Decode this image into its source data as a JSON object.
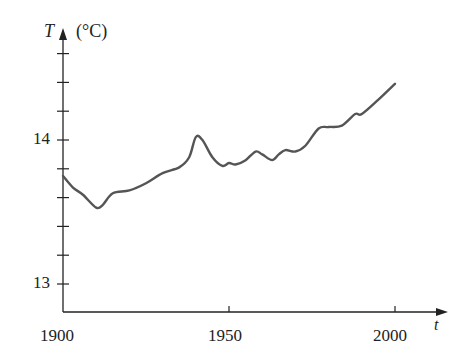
{
  "chart_data": {
    "type": "line",
    "title": "",
    "xlabel": "t",
    "ylabel": "T",
    "ylabel_unit": "(°C)",
    "xlim": [
      1900,
      2010
    ],
    "ylim": [
      12.8,
      14.7
    ],
    "x_ticks": [
      1900,
      1950,
      2000
    ],
    "x_tick_labels": [
      "1900",
      "1950",
      "2000"
    ],
    "y_ticks": [
      13.0,
      13.2,
      13.4,
      13.6,
      13.8,
      14.0,
      14.2,
      14.4,
      14.6
    ],
    "y_tick_labels": [
      "13",
      "",
      "",
      "",
      "",
      "14",
      "",
      "",
      ""
    ],
    "grid": false,
    "legend": null,
    "series": [
      {
        "name": "Global average temperature",
        "x": [
          1900,
          1903,
          1906,
          1910,
          1912,
          1915,
          1920,
          1925,
          1930,
          1935,
          1938,
          1940,
          1942,
          1945,
          1948,
          1950,
          1952,
          1955,
          1958,
          1960,
          1963,
          1965,
          1967,
          1970,
          1973,
          1977,
          1980,
          1984,
          1988,
          1990,
          1995,
          2000
        ],
        "values": [
          13.75,
          13.67,
          13.62,
          13.53,
          13.55,
          13.63,
          13.65,
          13.7,
          13.77,
          13.81,
          13.88,
          14.02,
          14.0,
          13.88,
          13.82,
          13.84,
          13.83,
          13.86,
          13.92,
          13.9,
          13.86,
          13.9,
          13.93,
          13.92,
          13.96,
          14.08,
          14.09,
          14.1,
          14.18,
          14.18,
          14.28,
          14.39
        ]
      }
    ]
  },
  "labels": {
    "y_axis_symbol": "T",
    "y_axis_unit": "(°C)",
    "x_axis_symbol": "t",
    "y14": "14",
    "y13": "13",
    "x1900": "1900",
    "x1950": "1950",
    "x2000": "2000"
  }
}
